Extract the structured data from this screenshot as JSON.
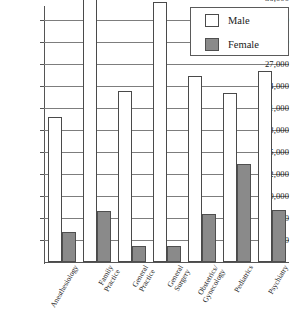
{
  "chart_data": {
    "type": "bar",
    "title": "",
    "subtitle": "",
    "xlabel": "",
    "ylabel": "",
    "grid": true,
    "legend_position": "top-right",
    "ylim": [
      0,
      37500
    ],
    "yticks": [
      3000,
      6000,
      9000,
      12000,
      15000,
      18000,
      21000,
      24000,
      27000,
      30000,
      33000,
      36000
    ],
    "ytick_labels": [
      "3,000",
      "6,000",
      "9,000",
      "12,000",
      "15,000",
      "18,000",
      "21,000",
      "24,000",
      "27,000",
      "30,000",
      "33,000",
      "36,000"
    ],
    "categories": [
      "Anesthesiology",
      "Family Practice",
      "General Practice",
      "General Surgery",
      "Obstetrics/ Gynecology",
      "Pediatrics",
      "Psychiatry"
    ],
    "category_lines": [
      [
        "Anesthesiology",
        ""
      ],
      [
        "Family",
        "Practice"
      ],
      [
        "General",
        "Practice"
      ],
      [
        "General",
        "Surgery"
      ],
      [
        "Obstetrics/",
        "Gynecology"
      ],
      [
        "Pediatrics",
        ""
      ],
      [
        "Psychiatry",
        ""
      ]
    ],
    "series": [
      {
        "name": "Male",
        "color": "#ffffff",
        "values": [
          19800,
          36500,
          23300,
          35400,
          25300,
          23100,
          26100
        ]
      },
      {
        "name": "Female",
        "color": "#8a8a8a",
        "values": [
          4100,
          6900,
          2200,
          2200,
          6500,
          13300,
          7100
        ]
      }
    ]
  },
  "legend": {
    "items": [
      {
        "label": "Male",
        "swatch": "male"
      },
      {
        "label": "Female",
        "swatch": "female"
      }
    ]
  },
  "colors": {
    "male_fill": "#ffffff",
    "female_fill": "#8a8a8a",
    "bar_stroke": "#4a4a4a",
    "gridline": "#7d7d7d",
    "axis": "#555555",
    "text": "#1a1a1a"
  }
}
